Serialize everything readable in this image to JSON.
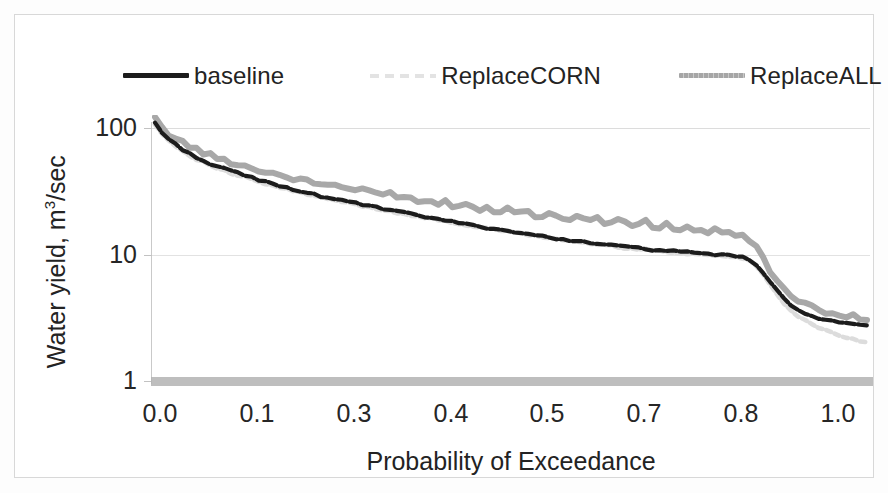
{
  "chart_data": {
    "type": "line",
    "title": "",
    "subtitle": "",
    "xlabel": "Probability of Exceedance",
    "ylabel": "Water yield, m3/sec",
    "ylabel_html": "Water yield, m<sup>3</sup>/sec",
    "yscale": "log",
    "ylim": [
      1,
      200
    ],
    "xlim": [
      0.0,
      1.03
    ],
    "grid": true,
    "grid_axis": "y",
    "legend_position": "top",
    "y_ticks": [
      "100",
      "10",
      "1"
    ],
    "y_tick_values": [
      100,
      10,
      1
    ],
    "x_ticks": [
      "0.0",
      "0.1",
      "0.3",
      "0.4",
      "0.5",
      "0.7",
      "0.8",
      "1.0"
    ],
    "x_tick_values": [
      0.0,
      0.1,
      0.3,
      0.4,
      0.5,
      0.7,
      0.8,
      1.0
    ],
    "legend": [
      "baseline",
      "ReplaceCORN",
      "ReplaceALL"
    ],
    "colors": {
      "baseline": "#1c1c1c",
      "ReplaceCORN": "#e0e0e0",
      "ReplaceALL": "#a8a8a8",
      "gridline": "#dcdcdc",
      "axis": "#c9c9c9",
      "text": "#232323",
      "background": "#ffffff"
    },
    "x": [
      0.0,
      0.01,
      0.02,
      0.03,
      0.04,
      0.05,
      0.06,
      0.07,
      0.08,
      0.09,
      0.1,
      0.11,
      0.12,
      0.13,
      0.14,
      0.15,
      0.16,
      0.17,
      0.18,
      0.19,
      0.2,
      0.21,
      0.22,
      0.23,
      0.24,
      0.25,
      0.26,
      0.27,
      0.28,
      0.29,
      0.3,
      0.31,
      0.32,
      0.33,
      0.34,
      0.35,
      0.36,
      0.37,
      0.38,
      0.39,
      0.4,
      0.41,
      0.42,
      0.43,
      0.44,
      0.45,
      0.46,
      0.47,
      0.48,
      0.49,
      0.5,
      0.51,
      0.52,
      0.53,
      0.54,
      0.55,
      0.56,
      0.57,
      0.58,
      0.59,
      0.6,
      0.61,
      0.62,
      0.63,
      0.64,
      0.65,
      0.66,
      0.67,
      0.68,
      0.69,
      0.7,
      0.71,
      0.72,
      0.73,
      0.74,
      0.75,
      0.76,
      0.77,
      0.78,
      0.79,
      0.8,
      0.81,
      0.82,
      0.83,
      0.84,
      0.85,
      0.86,
      0.87,
      0.88,
      0.89,
      0.9,
      0.91,
      0.92,
      0.93,
      0.94,
      0.95,
      0.96,
      0.97,
      0.98,
      0.99,
      1.0,
      1.01,
      1.02,
      1.03
    ],
    "series": [
      {
        "name": "baseline",
        "style": "solid-dashed",
        "color": "#1c1c1c",
        "values": [
          110,
          92,
          82,
          74,
          68,
          63,
          59,
          55,
          52,
          50,
          48,
          46,
          44,
          42,
          41,
          39,
          38,
          36,
          35,
          34,
          33,
          32,
          31,
          30,
          29,
          28.5,
          27.8,
          27.0,
          26.3,
          25.6,
          25.0,
          24.3,
          23.7,
          23.1,
          22.6,
          22.0,
          21.5,
          21.0,
          20.5,
          20.0,
          19.6,
          19.1,
          18.7,
          18.3,
          17.9,
          17.5,
          17.1,
          16.8,
          16.4,
          16.1,
          15.8,
          15.5,
          15.2,
          14.9,
          14.6,
          14.3,
          14.0,
          13.8,
          13.5,
          13.3,
          13.1,
          12.9,
          12.7,
          12.5,
          12.3,
          12.1,
          11.9,
          11.8,
          11.6,
          11.5,
          11.3,
          11.2,
          11.0,
          10.9,
          10.8,
          10.7,
          10.6,
          10.5,
          10.4,
          10.3,
          10.2,
          10.1,
          10.0,
          9.9,
          9.8,
          9.6,
          9.2,
          8.3,
          7.2,
          6.1,
          5.2,
          4.5,
          4.0,
          3.7,
          3.5,
          3.35,
          3.2,
          3.1,
          3.0,
          2.95,
          2.9,
          2.85,
          2.8,
          2.75
        ]
      },
      {
        "name": "ReplaceCORN",
        "style": "faint-dotted",
        "color": "#e0e0e0",
        "values": [
          108,
          90,
          80,
          72,
          66,
          61,
          57,
          54,
          51,
          48,
          46,
          44,
          42,
          41,
          39,
          38,
          36,
          35,
          34,
          33,
          32,
          31,
          30,
          29,
          28.3,
          27.6,
          27.0,
          26.3,
          25.6,
          25.0,
          24.4,
          23.8,
          23.2,
          22.6,
          22.1,
          21.6,
          21.1,
          20.6,
          20.1,
          19.7,
          19.3,
          18.8,
          18.4,
          18.0,
          17.6,
          17.2,
          16.9,
          16.5,
          16.2,
          15.9,
          15.6,
          15.3,
          15.0,
          14.7,
          14.4,
          14.1,
          13.9,
          13.6,
          13.4,
          13.1,
          12.9,
          12.7,
          12.5,
          12.3,
          12.1,
          11.9,
          11.8,
          11.6,
          11.4,
          11.3,
          11.1,
          11.0,
          10.9,
          10.7,
          10.6,
          10.5,
          10.4,
          10.3,
          10.2,
          10.1,
          10.0,
          9.9,
          9.8,
          9.7,
          9.6,
          9.4,
          9.0,
          8.1,
          7.0,
          5.9,
          4.9,
          4.2,
          3.7,
          3.3,
          3.05,
          2.85,
          2.7,
          2.55,
          2.45,
          2.35,
          2.25,
          2.2,
          2.1,
          2.05
        ]
      },
      {
        "name": "ReplaceALL",
        "style": "solid-noisy",
        "color": "#a8a8a8",
        "values": [
          118,
          100,
          90,
          83,
          77,
          72,
          68,
          64,
          61,
          58,
          56,
          54,
          52,
          50,
          48,
          47,
          45,
          44,
          43,
          41,
          40,
          39,
          38,
          37,
          36,
          35.5,
          36.5,
          34.0,
          33.2,
          32.5,
          34.0,
          31.0,
          30.3,
          29.7,
          31.5,
          28.5,
          27.9,
          29.5,
          26.9,
          26.4,
          26.0,
          25.5,
          27.0,
          24.7,
          24.3,
          25.8,
          23.6,
          23.2,
          24.5,
          22.6,
          22.2,
          23.5,
          21.6,
          21.3,
          22.5,
          20.7,
          20.4,
          21.5,
          19.9,
          19.6,
          19.4,
          20.5,
          18.9,
          18.7,
          19.8,
          18.2,
          18.0,
          19.0,
          17.6,
          17.4,
          17.2,
          18.2,
          16.8,
          16.6,
          17.5,
          16.2,
          16.0,
          16.8,
          15.6,
          15.4,
          15.2,
          15.9,
          14.8,
          14.6,
          14.4,
          14.0,
          13.2,
          11.5,
          9.5,
          7.6,
          6.2,
          5.3,
          4.7,
          4.3,
          4.05,
          3.9,
          3.75,
          3.6,
          3.5,
          3.4,
          3.35,
          3.3,
          3.2,
          3.1
        ]
      }
    ]
  },
  "legend": {
    "items": [
      {
        "label": "baseline",
        "swatch": "solid-line-icon"
      },
      {
        "label": "ReplaceCORN",
        "swatch": "faint-dashed-line-icon"
      },
      {
        "label": "ReplaceALL",
        "swatch": "gray-line-icon"
      }
    ]
  },
  "axes": {
    "y_title_prefix": "Water yield, m",
    "y_title_sup": "3",
    "y_title_suffix": "/sec",
    "x_title": "Probability of Exceedance",
    "y_labels": [
      "100",
      "10",
      "1"
    ],
    "x_labels": [
      "0.0",
      "0.1",
      "0.3",
      "0.4",
      "0.5",
      "0.7",
      "0.8",
      "1.0"
    ]
  }
}
